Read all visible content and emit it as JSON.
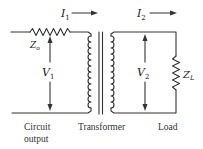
{
  "diagram": {
    "type": "transformer-impedance-matching-circuit",
    "line_color": "#333333",
    "labels": {
      "i1": {
        "main": "I",
        "sub": "1"
      },
      "i2": {
        "main": "I",
        "sub": "2"
      },
      "v1": {
        "main": "V",
        "sub": "1"
      },
      "v2": {
        "main": "V",
        "sub": "2"
      },
      "zo": {
        "main": "Z",
        "sub": "o"
      },
      "zl": {
        "main": "Z",
        "sub": "L"
      }
    },
    "captions": {
      "circuit_output_line1": "Circuit",
      "circuit_output_line2": "output",
      "transformer": "Transformer",
      "load": "Load"
    },
    "components": [
      {
        "name": "source-impedance",
        "symbol": "resistor",
        "label": "Zo"
      },
      {
        "name": "transformer",
        "symbol": "iron-core-transformer",
        "label": "Transformer"
      },
      {
        "name": "load-impedance",
        "symbol": "resistor",
        "label": "ZL"
      }
    ]
  }
}
